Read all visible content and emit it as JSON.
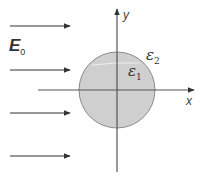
{
  "diagram": {
    "field_label": {
      "symbol": "E",
      "subscript": "0"
    },
    "inside_label": {
      "symbol": "ε",
      "subscript": "1"
    },
    "outside_label": {
      "symbol": "ε",
      "subscript": "2"
    },
    "x_axis_label": "x",
    "y_axis_label": "y",
    "field_arrows_count": 4,
    "colors": {
      "sphere_fill": "#cfcfcf",
      "sphere_stroke": "#8a8a8a",
      "axis": "#555555",
      "arrow": "#333333"
    }
  }
}
